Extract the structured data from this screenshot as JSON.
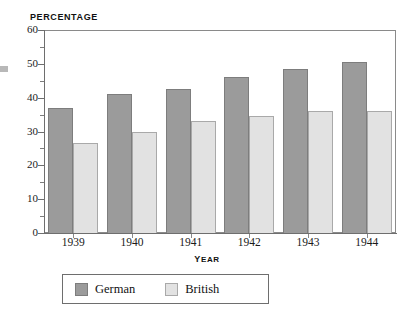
{
  "chart_data": {
    "type": "bar",
    "title": "Percentage",
    "xlabel": "Year",
    "ylabel": "",
    "categories": [
      "1939",
      "1940",
      "1941",
      "1942",
      "1943",
      "1944"
    ],
    "series": [
      {
        "name": "German",
        "color": "#9b9b9b",
        "values": [
          37,
          41,
          42.5,
          46,
          48.5,
          50.5
        ]
      },
      {
        "name": "British",
        "color": "#e2e2e2",
        "values": [
          26.5,
          30,
          33,
          34.5,
          36,
          36
        ]
      }
    ],
    "ylim": [
      0,
      60
    ],
    "ytick_labels": [
      "0",
      "10",
      "20",
      "30",
      "40",
      "50",
      "60"
    ],
    "ytick_values": [
      0,
      10,
      20,
      30,
      40,
      50,
      60
    ],
    "yminor_values": [
      5,
      15,
      25,
      35,
      45,
      55
    ],
    "grid": false,
    "legend_position": "bottom"
  },
  "legend": {
    "entries": [
      {
        "label": "German",
        "swatch": "german"
      },
      {
        "label": "British",
        "swatch": "british"
      }
    ]
  }
}
